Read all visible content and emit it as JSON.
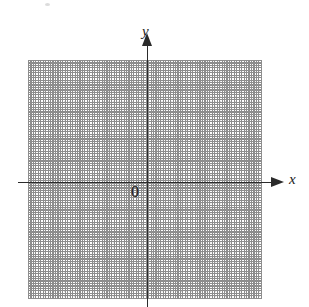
{
  "figure": {
    "width": 309,
    "height": 307,
    "background": "#ffffff",
    "title": ""
  },
  "chart_data": {
    "type": "scatter",
    "title": "",
    "subtitle": "",
    "xlabel": "x",
    "ylabel": "y",
    "series": [],
    "x": [],
    "values": [],
    "annotations": [
      "0"
    ],
    "legend": [],
    "legend_position": "none",
    "grid": true,
    "grid_style": "dotted",
    "grid_major_spacing": 19.5,
    "grid_minor_spacing": 4.88,
    "xlim": [
      -6,
      6
    ],
    "ylim": [
      -6,
      6
    ],
    "xticks": [],
    "yticks": []
  },
  "plane": {
    "origin_label": "0",
    "x_axis_label": "x",
    "y_axis_label": "y",
    "axis_color": "#2b2b2b",
    "grid_major_color": "#8d8d8d",
    "grid_minor_color": "#c9c9c9",
    "grid": {
      "left": 28,
      "top": 60,
      "width": 234,
      "height": 239,
      "major_spacing_px": 19.5,
      "minor_spacing_px": 4.88,
      "columns": 12,
      "rows": 12
    },
    "axes": {
      "x": {
        "y_px": 182,
        "start_px": 18,
        "end_px": 272,
        "arrow_tip_px": 285
      },
      "y": {
        "x_px": 147,
        "start_px": 307,
        "top_px": 46,
        "arrow_tip_px": 33
      }
    },
    "labels": {
      "x": {
        "left": 289,
        "top": 172
      },
      "y": {
        "left": 142,
        "top": 24
      },
      "origin": {
        "left": 131,
        "top": 184
      }
    }
  }
}
